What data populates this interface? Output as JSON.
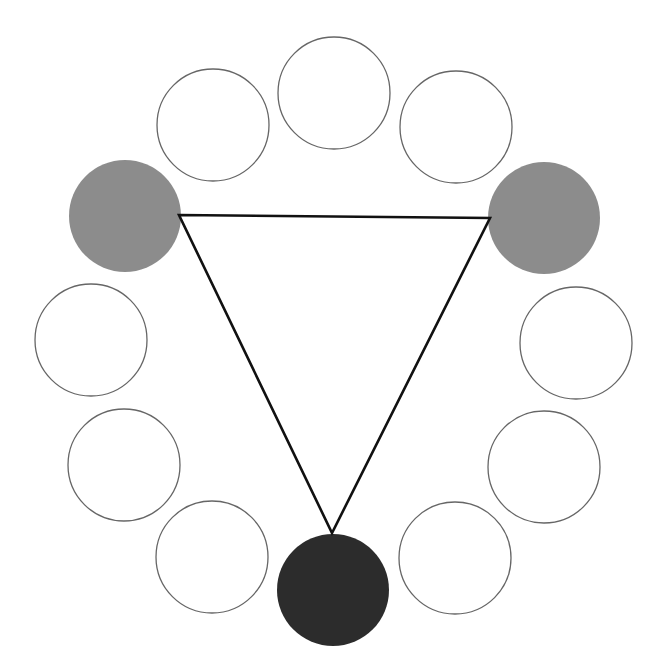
{
  "diagram": {
    "title": "",
    "type": "color-wheel-triad",
    "canvas": {
      "width": 652,
      "height": 661,
      "background": "#ffffff"
    },
    "circle_radius": 56,
    "outline_color": "#666666",
    "outline_width": 1.3,
    "colors": {
      "empty": "#ffffff",
      "medium_gray": "#8c8c8c",
      "dark": "#2c2c2c"
    },
    "circles": [
      {
        "id": "top",
        "cx": 334,
        "cy": 93,
        "fill": "empty"
      },
      {
        "id": "upper-right",
        "cx": 456,
        "cy": 127,
        "fill": "empty"
      },
      {
        "id": "right-upper",
        "cx": 544,
        "cy": 218,
        "fill": "medium_gray"
      },
      {
        "id": "right",
        "cx": 576,
        "cy": 343,
        "fill": "empty"
      },
      {
        "id": "lower-right",
        "cx": 544,
        "cy": 467,
        "fill": "empty"
      },
      {
        "id": "bottom-right",
        "cx": 455,
        "cy": 558,
        "fill": "empty"
      },
      {
        "id": "bottom",
        "cx": 333,
        "cy": 590,
        "fill": "dark"
      },
      {
        "id": "bottom-left",
        "cx": 212,
        "cy": 557,
        "fill": "empty"
      },
      {
        "id": "lower-left",
        "cx": 124,
        "cy": 465,
        "fill": "empty"
      },
      {
        "id": "left",
        "cx": 91,
        "cy": 340,
        "fill": "empty"
      },
      {
        "id": "left-upper",
        "cx": 125,
        "cy": 216,
        "fill": "medium_gray"
      },
      {
        "id": "upper-left",
        "cx": 213,
        "cy": 125,
        "fill": "empty"
      }
    ],
    "triangle": {
      "stroke": "#111111",
      "stroke_width": 2.6,
      "vertices": [
        {
          "x": 179,
          "y": 215
        },
        {
          "x": 490,
          "y": 218
        },
        {
          "x": 332,
          "y": 533
        }
      ]
    }
  }
}
